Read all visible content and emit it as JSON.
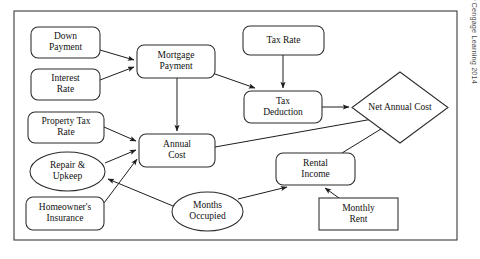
{
  "diagram": {
    "frame": {
      "x": 14,
      "y": 11,
      "width": 443,
      "height": 229
    },
    "credit": "© Cengage Learning 2014",
    "colors": {
      "background": "#ffffff",
      "shape_fill": "#ffffff",
      "shape_stroke": "#2b2b2b",
      "edge_stroke": "#1d1d1d",
      "text": "#111111",
      "credit_text": "#4a4a4a"
    },
    "nodes": [
      {
        "id": "down-payment",
        "shape": "rounded-rect",
        "lines": [
          "Down",
          "Payment"
        ],
        "x": 31,
        "y": 27,
        "w": 69,
        "h": 31
      },
      {
        "id": "interest-rate",
        "shape": "rounded-rect",
        "lines": [
          "Interest",
          "Rate"
        ],
        "x": 31,
        "y": 69,
        "w": 69,
        "h": 31
      },
      {
        "id": "property-tax-rate",
        "shape": "rounded-rect",
        "lines": [
          "Property Tax",
          "Rate"
        ],
        "x": 28,
        "y": 112,
        "w": 76,
        "h": 31
      },
      {
        "id": "repair-upkeep",
        "shape": "ellipse",
        "lines": [
          "Repair &",
          "Upkeep"
        ],
        "x": 30,
        "y": 152,
        "w": 75,
        "h": 39
      },
      {
        "id": "homeowners-insurance",
        "shape": "rounded-rect",
        "lines": [
          "Homeowner's",
          "Insurance"
        ],
        "x": 26,
        "y": 197,
        "w": 78,
        "h": 33
      },
      {
        "id": "mortgage-payment",
        "shape": "rounded-rect",
        "lines": [
          "Mortgage",
          "Payment"
        ],
        "x": 137,
        "y": 45,
        "w": 78,
        "h": 33
      },
      {
        "id": "annual-cost",
        "shape": "rounded-rect",
        "lines": [
          "Annual",
          "Cost"
        ],
        "x": 139,
        "y": 134,
        "w": 76,
        "h": 33
      },
      {
        "id": "months-occupied",
        "shape": "ellipse",
        "lines": [
          "Months",
          "Occupied"
        ],
        "x": 172,
        "y": 192,
        "w": 71,
        "h": 39
      },
      {
        "id": "tax-rate",
        "shape": "rounded-rect",
        "lines": [
          "Tax Rate"
        ],
        "x": 243,
        "y": 26,
        "w": 81,
        "h": 29
      },
      {
        "id": "tax-deduction",
        "shape": "rounded-rect",
        "lines": [
          "Tax",
          "Deduction"
        ],
        "x": 244,
        "y": 91,
        "w": 78,
        "h": 32
      },
      {
        "id": "rental-income",
        "shape": "rounded-rect",
        "lines": [
          "Rental",
          "Income"
        ],
        "x": 276,
        "y": 153,
        "w": 79,
        "h": 32
      },
      {
        "id": "monthly-rent",
        "shape": "rect",
        "lines": [
          "Monthly",
          "Rent"
        ],
        "x": 319,
        "y": 198,
        "w": 79,
        "h": 32
      },
      {
        "id": "net-annual-cost",
        "shape": "diamond",
        "lines": [
          "Net Annual Cost"
        ],
        "x": 352,
        "y": 72,
        "w": 96,
        "h": 71
      }
    ],
    "edges": [
      {
        "id": "down-payment-to-mortgage-payment",
        "from": "down-payment",
        "to": "mortgage-payment",
        "path": "M100,50 L134,60"
      },
      {
        "id": "interest-rate-to-mortgage-payment",
        "from": "interest-rate",
        "to": "mortgage-payment",
        "path": "M100,80 L134,67"
      },
      {
        "id": "mortgage-payment-to-annual-cost",
        "from": "mortgage-payment",
        "to": "annual-cost",
        "path": "M177,78 L177,131"
      },
      {
        "id": "mortgage-payment-to-tax-deduction",
        "from": "mortgage-payment",
        "to": "tax-deduction",
        "path": "M215,74 L255,88"
      },
      {
        "id": "tax-rate-to-tax-deduction",
        "from": "tax-rate",
        "to": "tax-deduction",
        "path": "M283,55 L283,88"
      },
      {
        "id": "tax-deduction-to-net-annual-cost",
        "from": "tax-deduction",
        "to": "net-annual-cost",
        "path": "M322,107 L349,107"
      },
      {
        "id": "property-tax-rate-to-annual-cost",
        "from": "property-tax-rate",
        "to": "annual-cost",
        "path": "M104,127 L136,141"
      },
      {
        "id": "repair-upkeep-to-annual-cost",
        "from": "repair-upkeep",
        "to": "annual-cost",
        "path": "M105,163 L136,150"
      },
      {
        "id": "homeowners-insurance-to-annual-cost",
        "from": "homeowners-insurance",
        "to": "annual-cost",
        "path": "M104,203 L137,159"
      },
      {
        "id": "months-occupied-to-repair-upkeep",
        "from": "months-occupied",
        "to": "repair-upkeep",
        "path": "M173,206 L108,179"
      },
      {
        "id": "months-occupied-to-rental-income",
        "from": "months-occupied",
        "to": "rental-income",
        "path": "M238,199 L287,187"
      },
      {
        "id": "monthly-rent-to-rental-income",
        "from": "monthly-rent",
        "to": "rental-income",
        "path": "M339,198 L325,188"
      },
      {
        "id": "annual-cost-to-net-annual-cost",
        "from": "annual-cost",
        "to": "net-annual-cost",
        "path": "M215,147 L384,117"
      },
      {
        "id": "rental-income-to-net-annual-cost",
        "from": "rental-income",
        "to": "net-annual-cost",
        "path": "M342,153 L394,121"
      }
    ]
  }
}
